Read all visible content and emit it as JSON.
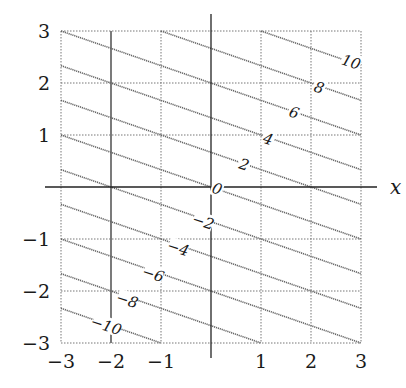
{
  "chart_data": {
    "type": "line",
    "subtype": "contour",
    "title": "",
    "function": "f(x, y) = x + 3y",
    "xlabel": "x",
    "ylabel": "y",
    "xlim": [
      -3,
      3
    ],
    "ylim": [
      -3,
      3
    ],
    "grid": true,
    "legend": null,
    "x_ticks": [
      -3,
      -2,
      -1,
      1,
      2,
      3
    ],
    "x_tick_labels": [
      "−3",
      "−2",
      "−1",
      "1",
      "2",
      "3"
    ],
    "y_ticks": [
      3,
      2,
      1,
      -1,
      -2,
      -3
    ],
    "y_tick_labels": [
      "3",
      "2",
      "1",
      "−1",
      "−2",
      "−3"
    ],
    "contour_levels": [
      -12,
      -10,
      -8,
      -6,
      -4,
      -2,
      0,
      2,
      4,
      6,
      8,
      10,
      12
    ],
    "contour_labels": [
      {
        "level": 10,
        "text": "10",
        "x": 2.8,
        "y": 2.4
      },
      {
        "level": 8,
        "text": "8",
        "x": 2.16,
        "y": 1.91
      },
      {
        "level": 6,
        "text": "6",
        "x": 1.66,
        "y": 1.43
      },
      {
        "level": 4,
        "text": "4",
        "x": 1.14,
        "y": 0.92
      },
      {
        "level": 2,
        "text": "2",
        "x": 0.66,
        "y": 0.43
      },
      {
        "level": 0,
        "text": "0",
        "x": 0.12,
        "y": -0.04
      },
      {
        "level": -2,
        "text": "−2",
        "x": -0.16,
        "y": -0.67
      },
      {
        "level": -4,
        "text": "−4",
        "x": -0.66,
        "y": -1.18
      },
      {
        "level": -6,
        "text": "−6",
        "x": -1.16,
        "y": -1.68
      },
      {
        "level": -8,
        "text": "−8",
        "x": -1.68,
        "y": -2.18
      },
      {
        "level": -10,
        "text": "−10",
        "x": -2.1,
        "y": -2.67
      }
    ],
    "series": [
      {
        "name": "f = -12",
        "points": [
          [
            -3,
            -3
          ]
        ]
      },
      {
        "name": "f = -10",
        "points": [
          [
            -3,
            -2.333
          ],
          [
            -1,
            -3
          ]
        ]
      },
      {
        "name": "f = -8",
        "points": [
          [
            -3,
            -1.667
          ],
          [
            1,
            -3
          ]
        ]
      },
      {
        "name": "f = -6",
        "points": [
          [
            -3,
            -1
          ],
          [
            3,
            -3
          ]
        ]
      },
      {
        "name": "f = -4",
        "points": [
          [
            -3,
            -0.333
          ],
          [
            3,
            -2.333
          ]
        ]
      },
      {
        "name": "f = -2",
        "points": [
          [
            -3,
            0.333
          ],
          [
            3,
            -1.667
          ]
        ]
      },
      {
        "name": "f = 0",
        "points": [
          [
            -3,
            1
          ],
          [
            3,
            -1
          ]
        ]
      },
      {
        "name": "f = 2",
        "points": [
          [
            -3,
            1.667
          ],
          [
            3,
            -0.333
          ]
        ]
      },
      {
        "name": "f = 4",
        "points": [
          [
            -3,
            2.333
          ],
          [
            3,
            0.333
          ]
        ]
      },
      {
        "name": "f = 6",
        "points": [
          [
            -3,
            3
          ],
          [
            3,
            1
          ]
        ]
      },
      {
        "name": "f = 8",
        "points": [
          [
            -1,
            3
          ],
          [
            3,
            1.667
          ]
        ]
      },
      {
        "name": "f = 10",
        "points": [
          [
            1,
            3
          ],
          [
            3,
            2.333
          ]
        ]
      },
      {
        "name": "f = 12",
        "points": [
          [
            3,
            3
          ]
        ]
      }
    ]
  },
  "layout": {
    "px_left": 61,
    "px_right": 361,
    "px_top": 31,
    "px_bottom": 343,
    "axis_x_extent": [
      45,
      377
    ],
    "axis_y_extent": [
      14,
      358
    ],
    "solid_grid_x": [
      -2
    ]
  }
}
